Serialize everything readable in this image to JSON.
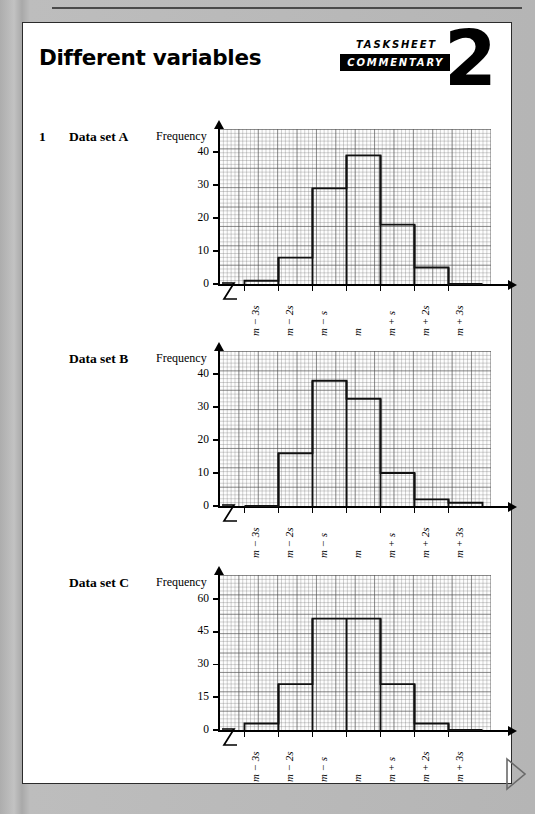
{
  "page": {
    "title": "Different variables",
    "badge": {
      "line1": "TASKSHEET",
      "line2": "COMMENTARY",
      "number": "2"
    },
    "question_number": "1"
  },
  "charts": [
    {
      "label": "Data set A",
      "ylabel": "Frequency",
      "chart_data": {
        "type": "bar",
        "title": "Data set A",
        "xlabel": "",
        "ylabel": "Frequency",
        "categories": [
          "m − 3s",
          "m − 2s",
          "m − s",
          "m",
          "m + s",
          "m + 2s",
          "m + 3s"
        ],
        "values": [
          1,
          8,
          29,
          39,
          18,
          5,
          0
        ],
        "yticks": [
          0,
          10,
          20,
          30,
          40
        ],
        "ylim": [
          0,
          47
        ],
        "grid": true,
        "legend": "none"
      }
    },
    {
      "label": "Data set B",
      "ylabel": "Frequency",
      "chart_data": {
        "type": "bar",
        "title": "Data set B",
        "xlabel": "",
        "ylabel": "Frequency",
        "categories": [
          "m − 3s",
          "m − 2s",
          "m − s",
          "m",
          "m + s",
          "m + 2s",
          "m + 3s"
        ],
        "values": [
          0,
          16,
          38,
          32.5,
          10,
          2,
          1
        ],
        "yticks": [
          0,
          10,
          20,
          30,
          40
        ],
        "ylim": [
          0,
          47
        ],
        "grid": true,
        "legend": "none"
      }
    },
    {
      "label": "Data set C",
      "ylabel": "Frequency",
      "chart_data": {
        "type": "bar",
        "title": "Data set C",
        "xlabel": "",
        "ylabel": "Frequency",
        "categories": [
          "m − 3s",
          "m − 2s",
          "m − s",
          "m",
          "m + s",
          "m + 2s",
          "m + 3s"
        ],
        "values": [
          3,
          21,
          51,
          51,
          21,
          3,
          0
        ],
        "yticks": [
          0,
          15,
          30,
          45,
          60
        ],
        "ylim": [
          0,
          71
        ],
        "grid": true,
        "legend": "none"
      }
    }
  ]
}
